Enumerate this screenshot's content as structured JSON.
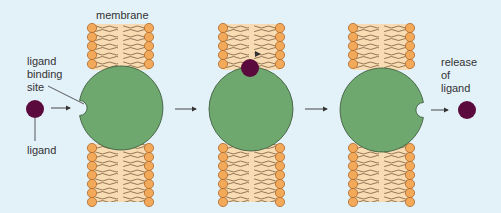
{
  "labels": {
    "membrane": "membrane",
    "ligand_binding_site": [
      "ligand",
      "binding",
      "site"
    ],
    "ligand": "ligand",
    "release_of_ligand": [
      "release",
      "of",
      "ligand"
    ]
  },
  "colors": {
    "background": "#e3f1f9",
    "protein": "#6fa86f",
    "protein_stroke": "#3f5f3f",
    "ligand": "#5a0a3c",
    "lipid_head": "#f2a95a",
    "lipid_head_stroke": "#b06a2a",
    "lipid_tail_band": "#f7dcb4",
    "arrow": "#333333"
  },
  "stages": [
    {
      "id": "unbound",
      "protein_center": [
        121,
        108
      ],
      "notch": "left",
      "membrane_x": [
        92,
        149
      ],
      "ligand_pos": [
        35,
        109
      ]
    },
    {
      "id": "bound",
      "protein_center": [
        251,
        109
      ],
      "notch": "none",
      "membrane_x": [
        223,
        279
      ],
      "ligand_pos": [
        250,
        68
      ]
    },
    {
      "id": "released",
      "protein_center": [
        382,
        108
      ],
      "notch": "right",
      "membrane_x": [
        353,
        410
      ],
      "ligand_pos": [
        467,
        110
      ]
    }
  ]
}
